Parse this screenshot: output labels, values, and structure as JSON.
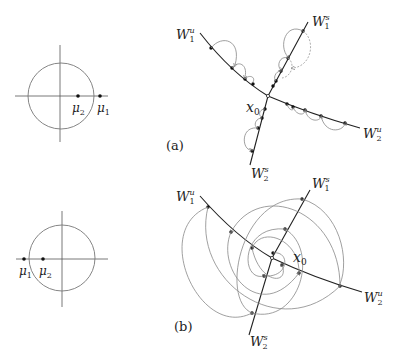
{
  "figure": {
    "top_left": {
      "eigenvalues": [
        {
          "symbol": "μ",
          "sub": "2",
          "position": "inside_unit_circle"
        },
        {
          "symbol": "μ",
          "sub": "1",
          "position": "outside_unit_circle"
        }
      ]
    },
    "bottom_left": {
      "eigenvalues": [
        {
          "symbol": "μ",
          "sub": "1",
          "position": "outside_unit_circle"
        },
        {
          "symbol": "μ",
          "sub": "2",
          "position": "inside_unit_circle"
        }
      ]
    },
    "panel_a": {
      "label": "(a)",
      "fixed_point": {
        "symbol": "x",
        "sub": "0"
      },
      "manifolds": [
        {
          "symbol": "W",
          "sub": "1",
          "sup": "u"
        },
        {
          "symbol": "W",
          "sub": "1",
          "sup": "s"
        },
        {
          "symbol": "W",
          "sub": "2",
          "sup": "u"
        },
        {
          "symbol": "W",
          "sub": "2",
          "sup": "s"
        }
      ]
    },
    "panel_b": {
      "label": "(b)",
      "fixed_point": {
        "symbol": "x",
        "sub": "0"
      },
      "manifolds": [
        {
          "symbol": "W",
          "sub": "1",
          "sup": "u"
        },
        {
          "symbol": "W",
          "sub": "1",
          "sup": "s"
        },
        {
          "symbol": "W",
          "sub": "2",
          "sup": "u"
        },
        {
          "symbol": "W",
          "sub": "2",
          "sup": "s"
        }
      ]
    }
  }
}
